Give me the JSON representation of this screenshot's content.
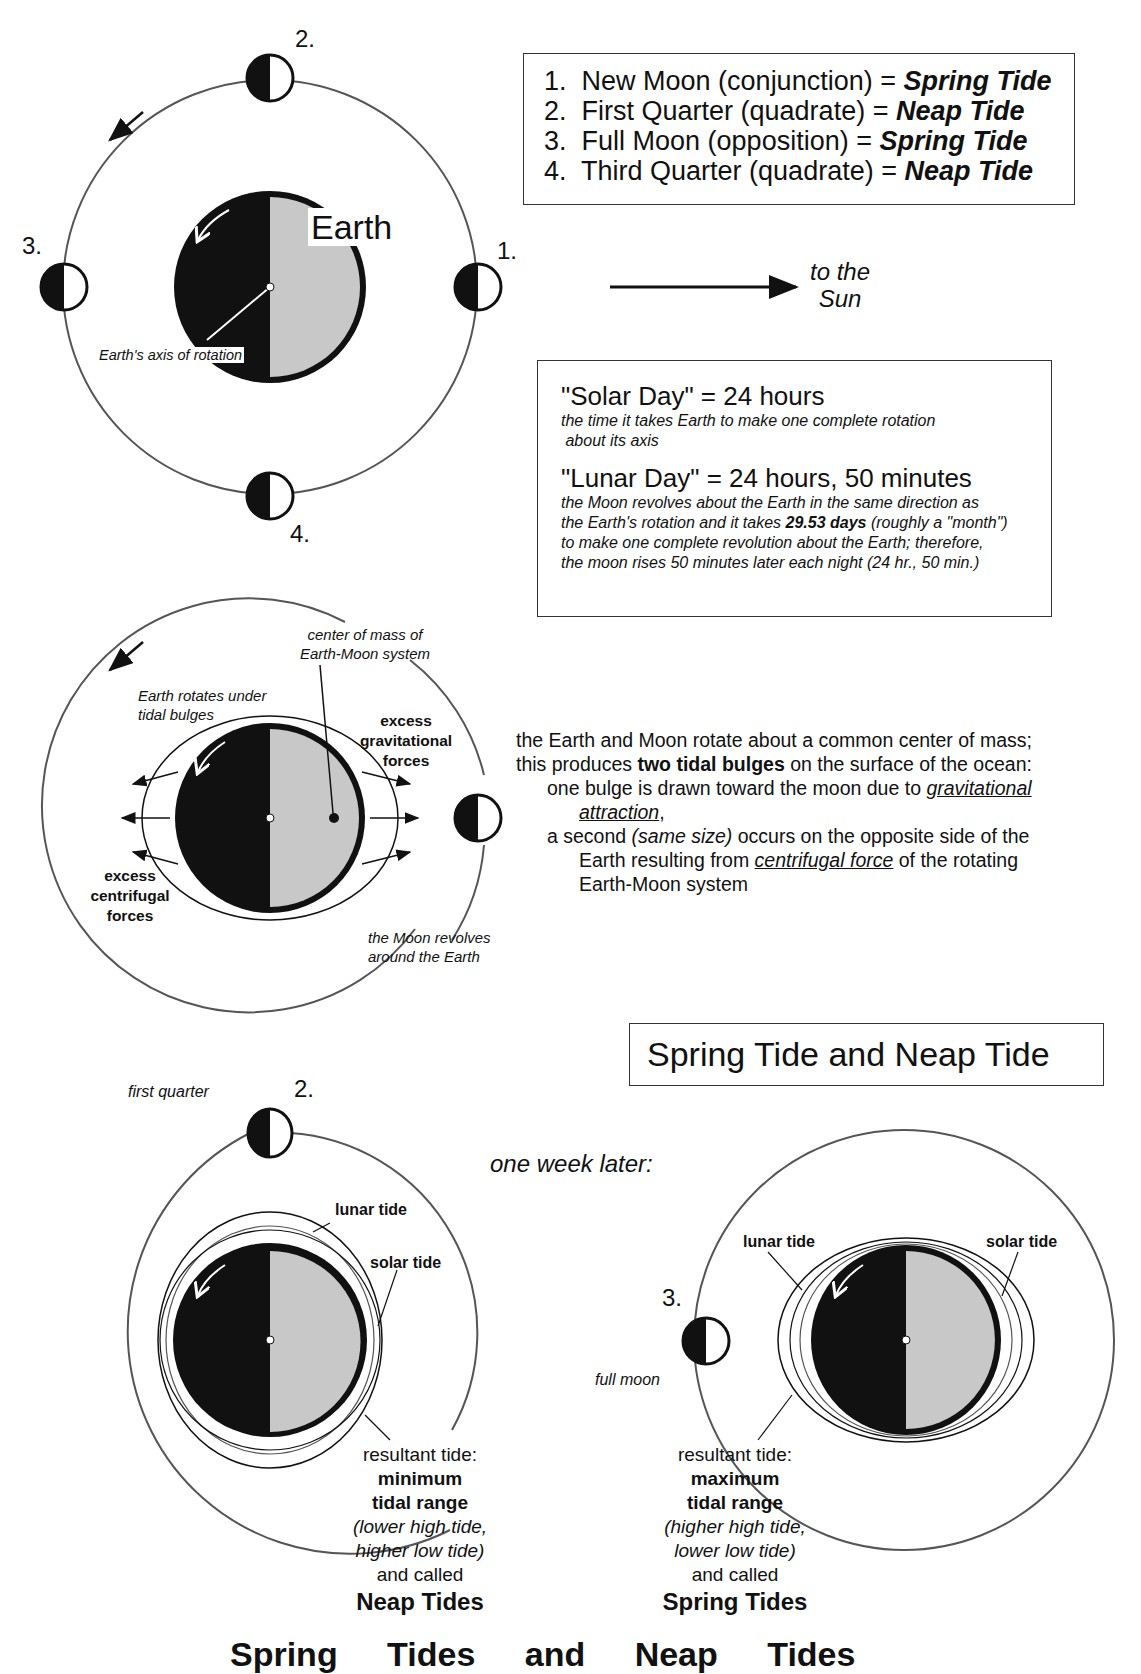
{
  "legend": {
    "items": [
      {
        "num": "1.",
        "phase": "New Moon (conjunction) = ",
        "tide": "Spring Tide"
      },
      {
        "num": "2.",
        "phase": "First Quarter (quadrate) = ",
        "tide": "Neap Tide"
      },
      {
        "num": "3.",
        "phase": "Full Moon (opposition) = ",
        "tide": "Spring Tide"
      },
      {
        "num": "4.",
        "phase": "Third Quarter (quadrate) = ",
        "tide": "Neap Tide"
      }
    ]
  },
  "diagram1": {
    "earth_label": "Earth",
    "axis_label": "Earth's axis of rotation",
    "moon_labels": [
      "1.",
      "2.",
      "3.",
      "4."
    ],
    "sun_label_line1": "to the",
    "sun_label_line2": "Sun"
  },
  "days_box": {
    "solar_title": "\"Solar Day\" = 24 hours",
    "solar_desc_1": "the time it takes Earth to make one complete rotation",
    "solar_desc_2": " about its axis",
    "lunar_title": "\"Lunar Day\" = 24 hours, 50 minutes",
    "lunar_desc_1": "the Moon revolves about the Earth in the same direction as",
    "lunar_desc_2a": "the Earth's rotation and it takes ",
    "lunar_desc_2b": "29.53 days",
    "lunar_desc_2c": " (roughly a \"month\")",
    "lunar_desc_3": "to make one complete revolution about the Earth;  therefore,",
    "lunar_desc_4": "the moon rises 50 minutes later each night (24 hr., 50 min.)"
  },
  "diagram2": {
    "center_mass_1": "center of mass of",
    "center_mass_2": "Earth-Moon system",
    "rotates_1": "Earth rotates under",
    "rotates_2": "tidal bulges",
    "grav_1": "excess",
    "grav_2": "gravitational",
    "grav_3": "forces",
    "centri_1": "excess",
    "centri_2": "centrifugal",
    "centri_3": "forces",
    "revolves_1": "the Moon revolves",
    "revolves_2": "around the Earth"
  },
  "bulge_text": {
    "l1": "the Earth and Moon rotate about a common center of mass;",
    "l2a": "this produces ",
    "l2b": "two tidal bulges",
    "l2c": " on the surface of the ocean:",
    "l3a": "one bulge is drawn toward the moon due to ",
    "l3b": "gravitational",
    "l4a": "attraction",
    "l4b": ",",
    "l5a": "a second ",
    "l5b": "(same size)",
    "l5c": " occurs on the opposite side of the",
    "l6a": "Earth resulting from ",
    "l6b": "centrifugal force",
    "l6c": " of the rotating",
    "l7": "Earth-Moon system"
  },
  "section_title": "Spring Tide and Neap Tide",
  "one_week_later": "one week later:",
  "neap": {
    "moon_caption": "first quarter",
    "moon_num": "2.",
    "lunar_tide": "lunar tide",
    "solar_tide": "solar tide",
    "r1": "resultant tide:",
    "r2": "minimum",
    "r3": "tidal range",
    "r4": "(lower high tide,",
    "r5": "higher low tide)",
    "r6": "and called",
    "r7": "Neap Tides"
  },
  "spring": {
    "moon_caption": "full moon",
    "moon_num": "3.",
    "lunar_tide": "lunar tide",
    "solar_tide": "solar tide",
    "r1": "resultant tide:",
    "r2": "maximum",
    "r3": "tidal range",
    "r4": "(higher high tide,",
    "r5": "lower low tide)",
    "r6": "and called",
    "r7": "Spring Tides"
  },
  "footer_clipped": "Spring Tides and Neap Tides",
  "colors": {
    "ink": "#111111",
    "day_side": "#c8c8c8",
    "orbit": "#555555"
  }
}
